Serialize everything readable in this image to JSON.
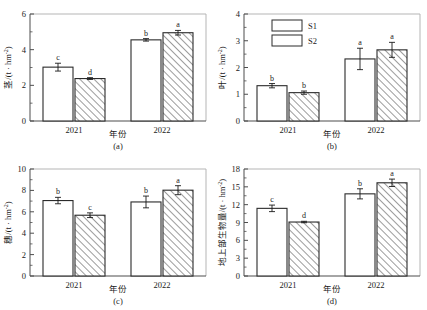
{
  "figure": {
    "legend": {
      "series": [
        {
          "key": "S1",
          "label": "S1",
          "pattern": "solid-white"
        },
        {
          "key": "S2",
          "label": "S2",
          "pattern": "diagonal-hatch"
        }
      ],
      "position": "top-left-of-panel-b"
    },
    "shared": {
      "xlabel": "年份",
      "categories": [
        "2021",
        "2022"
      ]
    }
  },
  "chart_data": [
    {
      "id": "a",
      "type": "bar",
      "tag": "(a)",
      "title": "",
      "ylabel": "茎/(t·hm⁻²)",
      "ylabel_main": "茎",
      "ylabel_unit": "/(t · hm",
      "ylabel_exp": "-2",
      "ylabel_close": ")",
      "xlabel": "年份",
      "categories": [
        "2021",
        "2022"
      ],
      "ylim": [
        0,
        6
      ],
      "yticks": [
        0,
        2,
        4,
        6
      ],
      "ytick_labels": [
        "0",
        "2",
        "4",
        "6"
      ],
      "minor_ticks_per_interval": 1,
      "grid": false,
      "series": [
        {
          "name": "S1",
          "values": [
            3.02,
            4.55
          ],
          "errors": [
            0.22,
            0.07
          ],
          "letters": [
            "c",
            "b"
          ]
        },
        {
          "name": "S2",
          "values": [
            2.38,
            4.95
          ],
          "errors": [
            0.05,
            0.13
          ],
          "letters": [
            "d",
            "a"
          ]
        }
      ]
    },
    {
      "id": "b",
      "type": "bar",
      "tag": "(b)",
      "title": "",
      "ylabel": "叶/(t·hm⁻²)",
      "ylabel_main": "叶",
      "ylabel_unit": "/(t · hm",
      "ylabel_exp": "-2",
      "ylabel_close": ")",
      "xlabel": "年份",
      "categories": [
        "2021",
        "2022"
      ],
      "ylim": [
        0,
        4
      ],
      "yticks": [
        0,
        1,
        2,
        3,
        4
      ],
      "ytick_labels": [
        "0",
        "1",
        "2",
        "3",
        "4"
      ],
      "minor_ticks_per_interval": 1,
      "grid": false,
      "series": [
        {
          "name": "S1",
          "values": [
            1.32,
            2.32
          ],
          "errors": [
            0.08,
            0.4
          ],
          "letters": [
            "b",
            "a"
          ]
        },
        {
          "name": "S2",
          "values": [
            1.06,
            2.66
          ],
          "errors": [
            0.06,
            0.28
          ],
          "letters": [
            "b",
            "a"
          ]
        }
      ]
    },
    {
      "id": "c",
      "type": "bar",
      "tag": "(c)",
      "title": "",
      "ylabel": "穗/(t·hm⁻²)",
      "ylabel_main": "穗",
      "ylabel_unit": "/(t · hm",
      "ylabel_exp": "-2",
      "ylabel_close": ")",
      "xlabel": "年份",
      "categories": [
        "2021",
        "2022"
      ],
      "ylim": [
        0,
        10
      ],
      "yticks": [
        0,
        2,
        4,
        6,
        8,
        10
      ],
      "ytick_labels": [
        "0",
        "2",
        "4",
        "6",
        "8",
        "10"
      ],
      "minor_ticks_per_interval": 1,
      "grid": false,
      "series": [
        {
          "name": "S1",
          "values": [
            7.05,
            6.92
          ],
          "errors": [
            0.3,
            0.55
          ],
          "letters": [
            "b",
            "b"
          ]
        },
        {
          "name": "S2",
          "values": [
            5.68,
            8.02
          ],
          "errors": [
            0.22,
            0.42
          ],
          "letters": [
            "c",
            "a"
          ]
        }
      ]
    },
    {
      "id": "d",
      "type": "bar",
      "tag": "(d)",
      "title": "",
      "ylabel": "地上部生物量/(t·hm⁻²)",
      "ylabel_main": "地上部生物量",
      "ylabel_unit": "/(t · hm",
      "ylabel_exp": "-2",
      "ylabel_close": ")",
      "xlabel": "年份",
      "categories": [
        "2021",
        "2022"
      ],
      "ylim": [
        0,
        18
      ],
      "yticks": [
        0,
        3,
        6,
        9,
        12,
        15,
        18
      ],
      "ytick_labels": [
        "0",
        "3",
        "6",
        "9",
        "12",
        "15",
        "18"
      ],
      "minor_ticks_per_interval": 1,
      "grid": false,
      "series": [
        {
          "name": "S1",
          "values": [
            11.38,
            13.82
          ],
          "errors": [
            0.55,
            0.85
          ],
          "letters": [
            "c",
            "b"
          ]
        },
        {
          "name": "S2",
          "values": [
            9.08,
            15.68
          ],
          "errors": [
            0.12,
            0.62
          ],
          "letters": [
            "d",
            "a"
          ]
        }
      ]
    }
  ]
}
